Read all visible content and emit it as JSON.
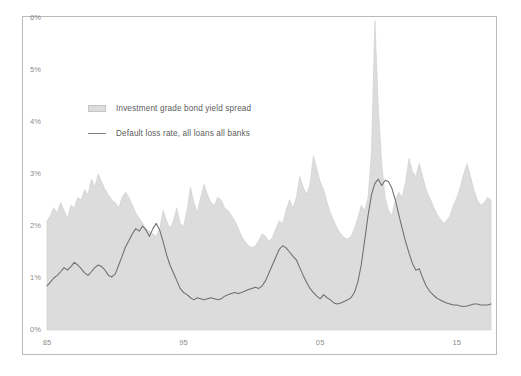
{
  "chart_data": {
    "type": "area",
    "title": "",
    "subtitle": "",
    "xlabel": "",
    "ylabel": "",
    "xlim": [
      1985.0,
      2017.5
    ],
    "ylim": [
      0,
      6
    ],
    "grid": false,
    "legend_position": "upper-left-inside",
    "y_ticks": [
      {
        "value": 0,
        "label": "0%"
      },
      {
        "value": 1,
        "label": "1%"
      },
      {
        "value": 2,
        "label": "2%"
      },
      {
        "value": 3,
        "label": "3%"
      },
      {
        "value": 4,
        "label": "4%"
      },
      {
        "value": 5,
        "label": "5%"
      },
      {
        "value": 6,
        "label": "6%"
      }
    ],
    "x_ticks": [
      {
        "value": 1985,
        "label": "85"
      },
      {
        "value": 1995,
        "label": "95"
      },
      {
        "value": 2005,
        "label": "05"
      },
      {
        "value": 2015,
        "label": "15"
      }
    ],
    "series": [
      {
        "name": "Investment grade bond yield spread",
        "type": "area",
        "color": "#dcdcdc",
        "edge_color": "#cccccc",
        "x": [
          1985.0,
          1985.25,
          1985.5,
          1985.75,
          1986.0,
          1986.25,
          1986.5,
          1986.75,
          1987.0,
          1987.25,
          1987.5,
          1987.75,
          1988.0,
          1988.25,
          1988.5,
          1988.75,
          1989.0,
          1989.25,
          1989.5,
          1989.75,
          1990.0,
          1990.25,
          1990.5,
          1990.75,
          1991.0,
          1991.25,
          1991.5,
          1991.75,
          1992.0,
          1992.25,
          1992.5,
          1992.75,
          1993.0,
          1993.25,
          1993.5,
          1993.75,
          1994.0,
          1994.25,
          1994.5,
          1994.75,
          1995.0,
          1995.25,
          1995.5,
          1995.75,
          1996.0,
          1996.25,
          1996.5,
          1996.75,
          1997.0,
          1997.25,
          1997.5,
          1997.75,
          1998.0,
          1998.25,
          1998.5,
          1998.75,
          1999.0,
          1999.25,
          1999.5,
          1999.75,
          2000.0,
          2000.25,
          2000.5,
          2000.75,
          2001.0,
          2001.25,
          2001.5,
          2001.75,
          2002.0,
          2002.25,
          2002.5,
          2002.75,
          2003.0,
          2003.25,
          2003.5,
          2003.75,
          2004.0,
          2004.25,
          2004.5,
          2004.75,
          2005.0,
          2005.25,
          2005.5,
          2005.75,
          2006.0,
          2006.25,
          2006.5,
          2006.75,
          2007.0,
          2007.25,
          2007.5,
          2007.75,
          2008.0,
          2008.25,
          2008.5,
          2008.75,
          2009.0,
          2009.25,
          2009.5,
          2009.75,
          2010.0,
          2010.25,
          2010.5,
          2010.75,
          2011.0,
          2011.25,
          2011.5,
          2011.75,
          2012.0,
          2012.25,
          2012.5,
          2012.75,
          2013.0,
          2013.25,
          2013.5,
          2013.75,
          2014.0,
          2014.25,
          2014.5,
          2014.75,
          2015.0,
          2015.25,
          2015.5,
          2015.75,
          2016.0,
          2016.25,
          2016.5,
          2016.75,
          2017.0,
          2017.25,
          2017.5
        ],
        "values": [
          2.1,
          2.2,
          2.35,
          2.25,
          2.45,
          2.3,
          2.15,
          2.4,
          2.35,
          2.55,
          2.5,
          2.7,
          2.6,
          2.9,
          2.75,
          3.0,
          2.85,
          2.7,
          2.6,
          2.5,
          2.45,
          2.35,
          2.55,
          2.65,
          2.55,
          2.4,
          2.25,
          2.15,
          2.05,
          1.95,
          1.9,
          1.85,
          1.8,
          1.95,
          2.3,
          2.1,
          1.95,
          2.1,
          2.35,
          2.05,
          2.0,
          2.3,
          2.75,
          2.45,
          2.25,
          2.55,
          2.8,
          2.6,
          2.45,
          2.4,
          2.55,
          2.5,
          2.35,
          2.3,
          2.2,
          2.1,
          1.95,
          1.8,
          1.7,
          1.62,
          1.58,
          1.62,
          1.72,
          1.85,
          1.8,
          1.7,
          1.78,
          1.95,
          2.1,
          2.05,
          2.3,
          2.5,
          2.35,
          2.55,
          2.95,
          2.75,
          2.6,
          2.8,
          3.35,
          3.1,
          2.85,
          2.7,
          2.45,
          2.25,
          2.1,
          1.95,
          1.85,
          1.78,
          1.75,
          1.8,
          1.95,
          2.15,
          2.4,
          2.3,
          2.55,
          3.4,
          5.95,
          4.3,
          3.2,
          2.55,
          2.3,
          2.2,
          2.5,
          2.65,
          2.55,
          2.85,
          3.3,
          3.05,
          2.95,
          3.2,
          2.95,
          2.7,
          2.55,
          2.4,
          2.25,
          2.15,
          2.05,
          2.1,
          2.2,
          2.4,
          2.55,
          2.75,
          3.0,
          3.2,
          2.95,
          2.7,
          2.5,
          2.4,
          2.45,
          2.55,
          2.5
        ]
      },
      {
        "name": "Default loss rate, all loans all banks",
        "type": "line",
        "color": "#6e6e6e",
        "x": [
          1985.0,
          1985.25,
          1985.5,
          1985.75,
          1986.0,
          1986.25,
          1986.5,
          1986.75,
          1987.0,
          1987.25,
          1987.5,
          1987.75,
          1988.0,
          1988.25,
          1988.5,
          1988.75,
          1989.0,
          1989.25,
          1989.5,
          1989.75,
          1990.0,
          1990.25,
          1990.5,
          1990.75,
          1991.0,
          1991.25,
          1991.5,
          1991.75,
          1992.0,
          1992.25,
          1992.5,
          1992.75,
          1993.0,
          1993.25,
          1993.5,
          1993.75,
          1994.0,
          1994.25,
          1994.5,
          1994.75,
          1995.0,
          1995.25,
          1995.5,
          1995.75,
          1996.0,
          1996.25,
          1996.5,
          1996.75,
          1997.0,
          1997.25,
          1997.5,
          1997.75,
          1998.0,
          1998.25,
          1998.5,
          1998.75,
          1999.0,
          1999.25,
          1999.5,
          1999.75,
          2000.0,
          2000.25,
          2000.5,
          2000.75,
          2001.0,
          2001.25,
          2001.5,
          2001.75,
          2002.0,
          2002.25,
          2002.5,
          2002.75,
          2003.0,
          2003.25,
          2003.5,
          2003.75,
          2004.0,
          2004.25,
          2004.5,
          2004.75,
          2005.0,
          2005.25,
          2005.5,
          2005.75,
          2006.0,
          2006.25,
          2006.5,
          2006.75,
          2007.0,
          2007.25,
          2007.5,
          2007.75,
          2008.0,
          2008.25,
          2008.5,
          2008.75,
          2009.0,
          2009.25,
          2009.5,
          2009.75,
          2010.0,
          2010.25,
          2010.5,
          2010.75,
          2011.0,
          2011.25,
          2011.5,
          2011.75,
          2012.0,
          2012.25,
          2012.5,
          2012.75,
          2013.0,
          2013.25,
          2013.5,
          2013.75,
          2014.0,
          2014.25,
          2014.5,
          2014.75,
          2015.0,
          2015.25,
          2015.5,
          2015.75,
          2016.0,
          2016.25,
          2016.5,
          2016.75,
          2017.0,
          2017.25,
          2017.5
        ],
        "values": [
          0.85,
          0.92,
          1.0,
          1.05,
          1.12,
          1.2,
          1.15,
          1.22,
          1.3,
          1.25,
          1.18,
          1.1,
          1.05,
          1.12,
          1.2,
          1.25,
          1.22,
          1.15,
          1.05,
          1.02,
          1.08,
          1.25,
          1.42,
          1.6,
          1.72,
          1.85,
          1.95,
          1.9,
          2.0,
          1.92,
          1.8,
          1.95,
          2.05,
          1.92,
          1.7,
          1.45,
          1.25,
          1.1,
          0.95,
          0.8,
          0.72,
          0.68,
          0.62,
          0.58,
          0.62,
          0.6,
          0.58,
          0.6,
          0.62,
          0.6,
          0.58,
          0.6,
          0.65,
          0.68,
          0.7,
          0.72,
          0.7,
          0.72,
          0.75,
          0.78,
          0.8,
          0.82,
          0.8,
          0.85,
          0.95,
          1.1,
          1.25,
          1.4,
          1.55,
          1.62,
          1.58,
          1.5,
          1.42,
          1.35,
          1.2,
          1.05,
          0.92,
          0.8,
          0.72,
          0.65,
          0.6,
          0.68,
          0.62,
          0.58,
          0.52,
          0.5,
          0.52,
          0.55,
          0.58,
          0.62,
          0.72,
          0.92,
          1.25,
          1.72,
          2.2,
          2.6,
          2.82,
          2.9,
          2.78,
          2.88,
          2.85,
          2.72,
          2.5,
          2.22,
          1.95,
          1.7,
          1.48,
          1.28,
          1.15,
          1.18,
          1.0,
          0.85,
          0.75,
          0.68,
          0.62,
          0.58,
          0.55,
          0.52,
          0.5,
          0.48,
          0.48,
          0.46,
          0.45,
          0.46,
          0.48,
          0.5,
          0.5,
          0.48,
          0.48,
          0.48,
          0.5
        ]
      }
    ],
    "legend": [
      {
        "label": "Investment grade bond yield spread",
        "marker": "area-swatch",
        "color": "#dcdcdc"
      },
      {
        "label": "Default loss rate, all loans all banks",
        "marker": "line-swatch",
        "color": "#7d7d7d"
      }
    ]
  },
  "colors": {
    "area_fill": "#dcdcdc",
    "area_edge": "#cccccc",
    "line": "#6e6e6e",
    "frame": "#b9b9b9",
    "tick_text": "#8d8d8d",
    "legend_text": "#5b5b5b",
    "background": "#ffffff"
  }
}
